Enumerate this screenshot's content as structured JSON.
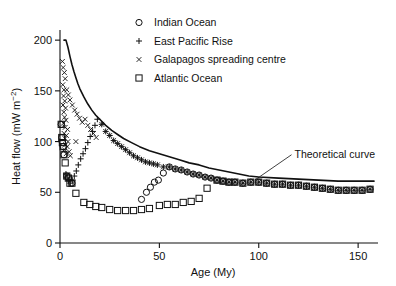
{
  "chart_data": {
    "type": "scatter",
    "title": "",
    "xlabel": "Age (My)",
    "ylabel": "Heat flow (mW m−2)",
    "ylabel_display": "Heat flow (mW m",
    "ylabel_exponent": "−2",
    "ylabel_close": ")",
    "xlim": [
      0,
      160
    ],
    "ylim": [
      0,
      210
    ],
    "xticks": [
      0,
      50,
      100,
      150
    ],
    "xticklabels": [
      "0",
      "50",
      "100",
      "150"
    ],
    "yticks": [
      0,
      50,
      100,
      150,
      200
    ],
    "yticklabels": [
      "0",
      "50",
      "100",
      "150",
      "200"
    ],
    "grid": false,
    "legend_position": "top-center",
    "annotations": [
      {
        "text": "Theoretical curve",
        "x": 118,
        "y": 88,
        "leader_from_x": 98,
        "leader_from_y": 62
      }
    ],
    "series": [
      {
        "name": "Indian Ocean",
        "marker": "circle",
        "points": [
          [
            0.6,
            117
          ],
          [
            0.9,
            104
          ],
          [
            1.2,
            99
          ],
          [
            1.6,
            95
          ],
          [
            2.0,
            87
          ],
          [
            3.4,
            66
          ],
          [
            4.2,
            64
          ],
          [
            6.0,
            59
          ],
          [
            41.0,
            43
          ],
          [
            43.5,
            50
          ],
          [
            45.5,
            55
          ],
          [
            47.5,
            60
          ],
          [
            49.5,
            62
          ],
          [
            52.0,
            69
          ],
          [
            55.0,
            75
          ],
          [
            58.0,
            73
          ],
          [
            61.0,
            72
          ],
          [
            64.0,
            70
          ],
          [
            67.0,
            68
          ],
          [
            70.0,
            67
          ],
          [
            73.0,
            65
          ],
          [
            76.0,
            64
          ],
          [
            79.0,
            62
          ],
          [
            82.0,
            61
          ],
          [
            85.0,
            60
          ],
          [
            88.0,
            60
          ],
          [
            92.0,
            59
          ],
          [
            96.0,
            60
          ],
          [
            100.0,
            60
          ],
          [
            104.0,
            59
          ],
          [
            108.0,
            58
          ],
          [
            112.0,
            58
          ],
          [
            116.0,
            57
          ],
          [
            120.0,
            57
          ],
          [
            124.0,
            56
          ],
          [
            128.0,
            55
          ],
          [
            132.0,
            54
          ],
          [
            136.0,
            53
          ],
          [
            140.0,
            52
          ],
          [
            144.0,
            52
          ],
          [
            148.0,
            52
          ],
          [
            152.0,
            52
          ],
          [
            156.0,
            53
          ]
        ]
      },
      {
        "name": "East Pacific Rise",
        "marker": "plus",
        "points": [
          [
            3.0,
            68
          ],
          [
            3.6,
            65
          ],
          [
            4.4,
            62
          ],
          [
            5.2,
            59
          ],
          [
            6.2,
            62
          ],
          [
            7.2,
            66
          ],
          [
            8.2,
            71
          ],
          [
            9.2,
            77
          ],
          [
            10.4,
            83
          ],
          [
            11.6,
            88
          ],
          [
            12.8,
            93
          ],
          [
            14.0,
            99
          ],
          [
            15.2,
            105
          ],
          [
            16.4,
            110
          ],
          [
            17.6,
            116
          ],
          [
            18.8,
            122
          ],
          [
            21.0,
            117
          ],
          [
            23.0,
            110
          ],
          [
            25.0,
            106
          ],
          [
            27.0,
            101
          ],
          [
            29.0,
            98
          ],
          [
            31.0,
            95
          ],
          [
            33.0,
            92
          ],
          [
            35.0,
            89
          ],
          [
            37.0,
            86
          ],
          [
            39.0,
            84
          ],
          [
            41.0,
            82
          ],
          [
            43.0,
            80
          ],
          [
            45.0,
            79
          ],
          [
            47.0,
            78
          ],
          [
            49.0,
            77
          ],
          [
            52.0,
            75
          ],
          [
            55.0,
            75
          ],
          [
            58.0,
            73
          ],
          [
            61.0,
            72
          ],
          [
            64.0,
            70
          ],
          [
            67.0,
            68
          ],
          [
            70.0,
            67
          ],
          [
            73.0,
            65
          ],
          [
            76.0,
            64
          ],
          [
            79.0,
            62
          ],
          [
            82.0,
            61
          ],
          [
            85.0,
            60
          ],
          [
            88.0,
            60
          ],
          [
            92.0,
            59
          ],
          [
            96.0,
            60
          ],
          [
            100.0,
            60
          ],
          [
            104.0,
            59
          ],
          [
            108.0,
            58
          ],
          [
            112.0,
            58
          ],
          [
            116.0,
            57
          ],
          [
            120.0,
            57
          ],
          [
            124.0,
            56
          ],
          [
            128.0,
            55
          ],
          [
            132.0,
            54
          ],
          [
            136.0,
            53
          ],
          [
            140.0,
            52
          ],
          [
            144.0,
            52
          ],
          [
            148.0,
            52
          ],
          [
            152.0,
            52
          ],
          [
            156.0,
            53
          ]
        ]
      },
      {
        "name": "Galapagos spreading centre",
        "marker": "cross",
        "points": [
          [
            1.2,
            179
          ],
          [
            1.6,
            173
          ],
          [
            2.2,
            168
          ],
          [
            2.6,
            162
          ],
          [
            1.4,
            156
          ],
          [
            2.0,
            151
          ],
          [
            3.4,
            151
          ],
          [
            1.8,
            145
          ],
          [
            2.4,
            140
          ],
          [
            1.5,
            136
          ],
          [
            2.8,
            133
          ],
          [
            1.9,
            129
          ],
          [
            4.2,
            146
          ],
          [
            5.0,
            141
          ],
          [
            6.2,
            136
          ],
          [
            2.3,
            124
          ],
          [
            3.0,
            121
          ],
          [
            1.7,
            118
          ],
          [
            2.6,
            114
          ],
          [
            3.8,
            112
          ],
          [
            2.1,
            108
          ],
          [
            3.2,
            106
          ],
          [
            2.5,
            103
          ],
          [
            4.0,
            100
          ],
          [
            2.9,
            97
          ],
          [
            3.6,
            95
          ],
          [
            2.2,
            92
          ],
          [
            4.6,
            90
          ],
          [
            3.1,
            88
          ],
          [
            5.2,
            86
          ],
          [
            7.4,
            131
          ],
          [
            8.6,
            127
          ],
          [
            9.8,
            123
          ],
          [
            11.2,
            119
          ],
          [
            12.6,
            122
          ],
          [
            14.0,
            116
          ],
          [
            15.4,
            112
          ],
          [
            16.8,
            108
          ],
          [
            18.2,
            104
          ],
          [
            8.0,
            100
          ],
          [
            21.0,
            117
          ],
          [
            23.0,
            110
          ],
          [
            25.0,
            106
          ],
          [
            27.0,
            101
          ],
          [
            29.0,
            98
          ],
          [
            31.0,
            95
          ],
          [
            33.0,
            92
          ],
          [
            35.0,
            89
          ],
          [
            37.0,
            86
          ],
          [
            39.0,
            84
          ],
          [
            41.0,
            82
          ],
          [
            43.0,
            80
          ],
          [
            45.0,
            79
          ],
          [
            47.0,
            78
          ],
          [
            49.0,
            77
          ],
          [
            52.0,
            75
          ],
          [
            55.0,
            75
          ],
          [
            58.0,
            73
          ],
          [
            61.0,
            72
          ],
          [
            64.0,
            70
          ],
          [
            67.0,
            68
          ],
          [
            70.0,
            67
          ],
          [
            73.0,
            65
          ],
          [
            76.0,
            64
          ],
          [
            79.0,
            62
          ],
          [
            82.0,
            61
          ],
          [
            85.0,
            60
          ],
          [
            88.0,
            60
          ],
          [
            92.0,
            59
          ],
          [
            96.0,
            60
          ],
          [
            100.0,
            60
          ],
          [
            104.0,
            59
          ],
          [
            108.0,
            58
          ],
          [
            112.0,
            58
          ],
          [
            116.0,
            57
          ],
          [
            120.0,
            57
          ],
          [
            124.0,
            56
          ],
          [
            128.0,
            55
          ],
          [
            132.0,
            54
          ],
          [
            136.0,
            53
          ],
          [
            140.0,
            52
          ],
          [
            144.0,
            52
          ],
          [
            148.0,
            52
          ],
          [
            152.0,
            52
          ],
          [
            156.0,
            53
          ]
        ]
      },
      {
        "name": "Atlantic Ocean",
        "marker": "square",
        "points": [
          [
            0.6,
            117
          ],
          [
            0.9,
            104
          ],
          [
            1.2,
            99
          ],
          [
            1.6,
            95
          ],
          [
            2.0,
            87
          ],
          [
            2.6,
            79
          ],
          [
            3.4,
            66
          ],
          [
            4.2,
            64
          ],
          [
            5.0,
            59
          ],
          [
            6.0,
            59
          ],
          [
            8.0,
            49
          ],
          [
            12.0,
            40
          ],
          [
            15.0,
            38
          ],
          [
            18.0,
            36
          ],
          [
            21.0,
            35
          ],
          [
            25.0,
            33
          ],
          [
            29.0,
            32
          ],
          [
            33.0,
            32
          ],
          [
            37.0,
            32
          ],
          [
            41.0,
            33
          ],
          [
            45.0,
            34
          ],
          [
            50.0,
            37
          ],
          [
            54.0,
            38
          ],
          [
            58.0,
            38
          ],
          [
            62.0,
            40
          ],
          [
            66.0,
            41
          ],
          [
            70.0,
            44
          ],
          [
            74.0,
            54
          ],
          [
            79.0,
            62
          ],
          [
            82.0,
            61
          ],
          [
            85.0,
            60
          ],
          [
            88.0,
            60
          ],
          [
            92.0,
            59
          ],
          [
            96.0,
            60
          ],
          [
            100.0,
            60
          ],
          [
            104.0,
            59
          ],
          [
            108.0,
            58
          ],
          [
            112.0,
            58
          ],
          [
            116.0,
            57
          ],
          [
            120.0,
            57
          ],
          [
            124.0,
            56
          ],
          [
            128.0,
            55
          ],
          [
            132.0,
            54
          ],
          [
            136.0,
            53
          ],
          [
            140.0,
            52
          ],
          [
            144.0,
            52
          ],
          [
            148.0,
            52
          ],
          [
            152.0,
            52
          ],
          [
            156.0,
            53
          ]
        ]
      }
    ],
    "theoretical_curve": {
      "label": "Theoretical curve",
      "points": [
        [
          2.0,
          200
        ],
        [
          3.0,
          200
        ],
        [
          4.0,
          193
        ],
        [
          5.0,
          184
        ],
        [
          6.0,
          176
        ],
        [
          7.0,
          169
        ],
        [
          8.0,
          163
        ],
        [
          9.0,
          157
        ],
        [
          10.0,
          152
        ],
        [
          12.0,
          144
        ],
        [
          14.0,
          137
        ],
        [
          16.0,
          131
        ],
        [
          18.0,
          126
        ],
        [
          20.0,
          122
        ],
        [
          23.0,
          116
        ],
        [
          26.0,
          111
        ],
        [
          29.0,
          107
        ],
        [
          32.0,
          103
        ],
        [
          36.0,
          99
        ],
        [
          40.0,
          95
        ],
        [
          45.0,
          91
        ],
        [
          50.0,
          88
        ],
        [
          55.0,
          85
        ],
        [
          60.0,
          82
        ],
        [
          65.0,
          79
        ],
        [
          70.0,
          77
        ],
        [
          75.0,
          74
        ],
        [
          80.0,
          72
        ],
        [
          85.0,
          70
        ],
        [
          90.0,
          68
        ],
        [
          95.0,
          66
        ],
        [
          100.0,
          65
        ],
        [
          110.0,
          64
        ],
        [
          120.0,
          63
        ],
        [
          130.0,
          62
        ],
        [
          140.0,
          61
        ],
        [
          150.0,
          61
        ],
        [
          158.0,
          61
        ]
      ]
    },
    "legend": [
      {
        "label": "Indian Ocean",
        "marker": "circle"
      },
      {
        "label": "East Pacific Rise",
        "marker": "plus"
      },
      {
        "label": "Galapagos spreading centre",
        "marker": "cross"
      },
      {
        "label": "Atlantic Ocean",
        "marker": "square"
      }
    ]
  }
}
